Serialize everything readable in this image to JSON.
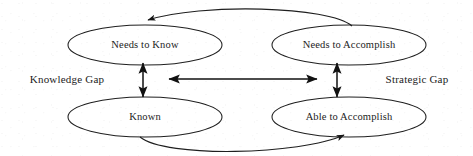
{
  "diagram": {
    "background_color": "#ffffff",
    "stroke_color": "#1f1f1f",
    "text_color": "#1c1c1c",
    "nodes": [
      {
        "id": "needs-to-know",
        "label": "Needs to Know",
        "cx": 145,
        "cy": 45,
        "rx": 77,
        "ry": 20
      },
      {
        "id": "needs-to-accomplish",
        "label": "Needs to Accomplish",
        "cx": 349,
        "cy": 45,
        "rx": 77,
        "ry": 20
      },
      {
        "id": "known",
        "label": "Known",
        "cx": 145,
        "cy": 117,
        "rx": 77,
        "ry": 20
      },
      {
        "id": "able-to-accomplish",
        "label": "Able to Accomplish",
        "cx": 349,
        "cy": 117,
        "rx": 77,
        "ry": 20
      }
    ],
    "side_labels": [
      {
        "id": "knowledge-gap",
        "label": "Knowledge Gap",
        "x": 67,
        "y": 80
      },
      {
        "id": "strategic-gap",
        "label": "Strategic Gap",
        "x": 417,
        "y": 80
      }
    ],
    "connectors": [
      {
        "id": "knowledge-gap-arrow",
        "type": "double-headed-vertical",
        "from": "needs-to-know",
        "to": "known"
      },
      {
        "id": "strategic-gap-arrow",
        "type": "double-headed-vertical",
        "from": "needs-to-accomplish",
        "to": "able-to-accomplish"
      },
      {
        "id": "needs-alignment-arrow",
        "type": "double-headed-horizontal",
        "from": "needs-to-know",
        "to": "needs-to-accomplish"
      },
      {
        "id": "top-feedback-curve",
        "type": "curved-arrow",
        "from": "needs-to-accomplish",
        "to": "needs-to-know"
      },
      {
        "id": "bottom-feedback-curve",
        "type": "curved-arrow",
        "from": "known",
        "to": "able-to-accomplish"
      }
    ]
  }
}
